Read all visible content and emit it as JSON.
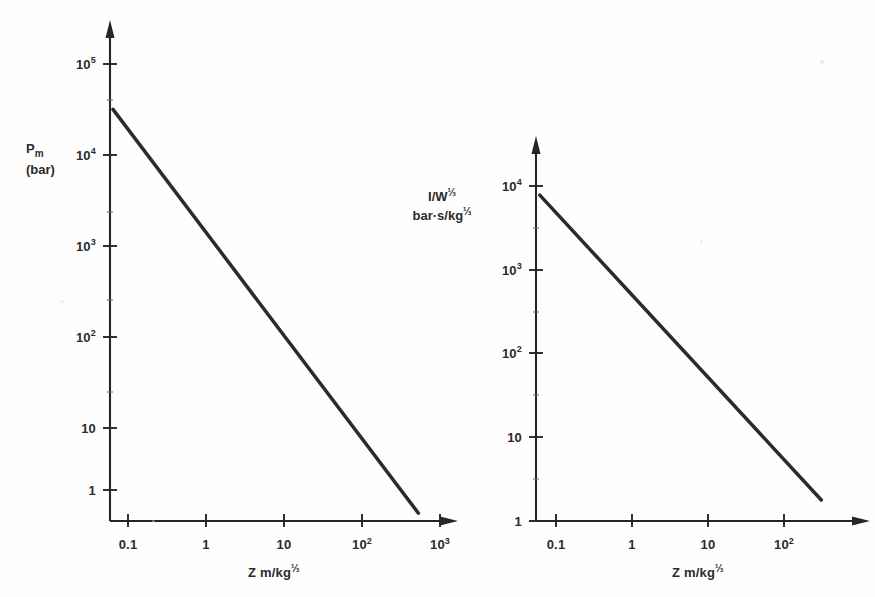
{
  "figure": {
    "background_color": "#fefefe",
    "ink_color": "#2b2b2b",
    "panel_count": 2
  },
  "chart_data": [
    {
      "type": "line",
      "id": "left-panel",
      "title": "",
      "subtitle": "",
      "xlabel": "Z m/kg⅓",
      "ylabel": "Pm (bar)",
      "ylabel_symbol": "P",
      "ylabel_subscript": "m",
      "ylabel_units": "(bar)",
      "xscale": "log",
      "yscale": "log",
      "xlim": [
        0.05,
        2000
      ],
      "ylim": [
        0.5,
        300000
      ],
      "xtick_labels": [
        "0.1",
        "1",
        "10",
        "10²",
        "10³"
      ],
      "xtick_values": [
        0.1,
        1,
        10,
        100,
        1000
      ],
      "ytick_labels": [
        "10⁵",
        "10⁴",
        "10³",
        "10²",
        "10",
        "1"
      ],
      "ytick_values": [
        100000,
        10000,
        1000,
        100,
        10,
        1
      ],
      "grid": false,
      "legend": null,
      "series": [
        {
          "name": "Peak overpressure Pm",
          "x": [
            0.055,
            1000
          ],
          "y": [
            40000,
            0.62
          ]
        }
      ],
      "annotations": []
    },
    {
      "type": "line",
      "id": "right-panel",
      "title": "",
      "subtitle": "",
      "xlabel": "Z m/kg⅓",
      "ylabel": "I/W⅓ bar·s/kg⅓",
      "ylabel_line1": "I/W⅓",
      "ylabel_line2": "bar·s/kg⅓",
      "xscale": "log",
      "yscale": "log",
      "xlim": [
        0.05,
        400
      ],
      "ylim": [
        1,
        30000
      ],
      "xtick_labels": [
        "0.1",
        "1",
        "10",
        "10²"
      ],
      "xtick_values": [
        0.1,
        1,
        10,
        100
      ],
      "ytick_labels": [
        "10⁴",
        "10³",
        "10²",
        "10",
        "1"
      ],
      "ytick_values": [
        10000,
        1000,
        100,
        10,
        1
      ],
      "grid": false,
      "legend": null,
      "series": [
        {
          "name": "Scaled impulse I/W^1/3",
          "x": [
            0.056,
            230
          ],
          "y": [
            9000,
            1.8
          ]
        }
      ],
      "annotations": []
    }
  ],
  "left_chart": {
    "yaxis": {
      "symbol": "P",
      "subscript": "m",
      "units": "(bar)",
      "ticks": [
        {
          "label_mantissa": "10",
          "label_exponent": "5",
          "value": 100000
        },
        {
          "label_mantissa": "10",
          "label_exponent": "4",
          "value": 10000
        },
        {
          "label_mantissa": "10",
          "label_exponent": "3",
          "value": 1000
        },
        {
          "label_mantissa": "10",
          "label_exponent": "2",
          "value": 100
        },
        {
          "label_mantissa": "10",
          "label_exponent": "",
          "value": 10
        },
        {
          "label_mantissa": "1",
          "label_exponent": "",
          "value": 1
        }
      ]
    },
    "xaxis": {
      "title_prefix": "Z m/kg",
      "title_exponent": "⅓",
      "ticks": [
        {
          "label_mantissa": "0.1",
          "label_exponent": "",
          "value": 0.1
        },
        {
          "label_mantissa": "1",
          "label_exponent": "",
          "value": 1
        },
        {
          "label_mantissa": "10",
          "label_exponent": "",
          "value": 10
        },
        {
          "label_mantissa": "10",
          "label_exponent": "2",
          "value": 100
        },
        {
          "label_mantissa": "10",
          "label_exponent": "3",
          "value": 1000
        }
      ]
    }
  },
  "right_chart": {
    "yaxis": {
      "line1_prefix": "I/W",
      "line1_exponent": "⅓",
      "line2_prefix": "bar·s/kg",
      "line2_exponent": "⅓",
      "ticks": [
        {
          "label_mantissa": "10",
          "label_exponent": "4",
          "value": 10000
        },
        {
          "label_mantissa": "10",
          "label_exponent": "3",
          "value": 1000
        },
        {
          "label_mantissa": "10",
          "label_exponent": "2",
          "value": 100
        },
        {
          "label_mantissa": "10",
          "label_exponent": "",
          "value": 10
        },
        {
          "label_mantissa": "1",
          "label_exponent": "",
          "value": 1
        }
      ]
    },
    "xaxis": {
      "title_prefix": "Z m/kg",
      "title_exponent": "⅓",
      "ticks": [
        {
          "label_mantissa": "0.1",
          "label_exponent": "",
          "value": 0.1
        },
        {
          "label_mantissa": "1",
          "label_exponent": "",
          "value": 1
        },
        {
          "label_mantissa": "10",
          "label_exponent": "",
          "value": 10
        },
        {
          "label_mantissa": "10",
          "label_exponent": "2",
          "value": 100
        }
      ]
    }
  }
}
